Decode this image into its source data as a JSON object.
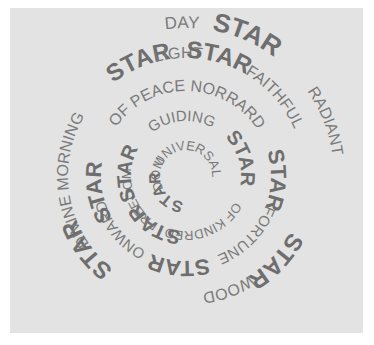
{
  "artwork": {
    "background_color": "#e3e3e3",
    "ink_color": "#787878",
    "center": [
      186,
      176
    ],
    "rings": [
      {
        "radius": 26,
        "words": [
          {
            "text": "UNIVERSAL",
            "start": 200,
            "size": 13,
            "bold": false
          },
          {
            "text": "STAR",
            "start": 95,
            "size": 16,
            "bold": true
          },
          {
            "text": "DOM",
            "start": 150,
            "size": 13,
            "bold": false
          }
        ]
      },
      {
        "radius": 55,
        "words": [
          {
            "text": "GUIDING",
            "start": 232,
            "size": 15,
            "bold": false
          },
          {
            "text": "STAR",
            "start": 315,
            "size": 20,
            "bold": true
          },
          {
            "text": "OF",
            "start": 28,
            "size": 13,
            "bold": false
          },
          {
            "text": "KINDRED",
            "start": 50,
            "size": 13,
            "bold": false
          },
          {
            "text": "STAR",
            "start": 95,
            "size": 20,
            "bold": true
          },
          {
            "text": "FREEDOM",
            "start": 120,
            "size": 13,
            "bold": false
          },
          {
            "text": "STAR",
            "start": 155,
            "size": 20,
            "bold": true
          }
        ]
      },
      {
        "radius": 85,
        "words": [
          {
            "text": "OF PEACE NORRARD",
            "start": 215,
            "size": 16,
            "bold": false
          },
          {
            "text": "STAR",
            "start": 343,
            "size": 22,
            "bold": true
          },
          {
            "text": "FORTUNE",
            "start": 20,
            "size": 15,
            "bold": false
          },
          {
            "text": "STAR",
            "start": 75,
            "size": 22,
            "bold": true
          },
          {
            "text": "ONWARD",
            "start": 118,
            "size": 15,
            "bold": false
          },
          {
            "text": "STAR",
            "start": 150,
            "size": 22,
            "bold": true
          }
        ]
      },
      {
        "radius": 118,
        "words": [
          {
            "text": "STAR",
            "start": 232,
            "size": 24,
            "bold": true
          },
          {
            "text": "LIGHT",
            "start": 255,
            "size": 16,
            "bold": false
          },
          {
            "text": "STAR",
            "start": 270,
            "size": 24,
            "bold": true
          },
          {
            "text": "FAITHFUL",
            "start": 300,
            "size": 16,
            "bold": false
          },
          {
            "text": "STAR",
            "start": 28,
            "size": 24,
            "bold": true
          },
          {
            "text": "WOOD",
            "start": 57,
            "size": 16,
            "bold": false
          },
          {
            "text": "STAR",
            "start": 128,
            "size": 24,
            "bold": true
          },
          {
            "text": "DIVINE MORNING",
            "start": 145,
            "size": 16,
            "bold": false
          }
        ]
      },
      {
        "radius": 148,
        "words": [
          {
            "text": "DAY",
            "start": 262,
            "size": 17,
            "bold": false
          },
          {
            "text": "STAR",
            "start": 280,
            "size": 26,
            "bold": true
          },
          {
            "text": "RADIANT",
            "start": 325,
            "size": 16,
            "bold": false
          }
        ]
      }
    ]
  }
}
